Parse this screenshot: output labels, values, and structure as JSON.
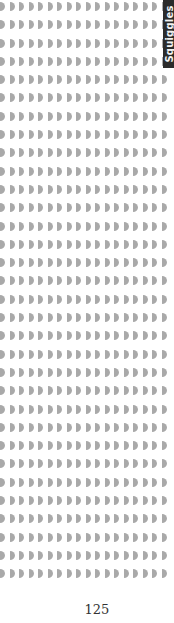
{
  "page": {
    "type": "worksheet",
    "pattern": {
      "glyph": "half-circle-right",
      "glyph_color": "#a9a9a9",
      "rows": 32,
      "columns": 18
    },
    "section_tab": {
      "label": "Squiggles",
      "background": "#2b2b2b",
      "text_color": "#f2f2f2"
    },
    "page_number": "125"
  }
}
